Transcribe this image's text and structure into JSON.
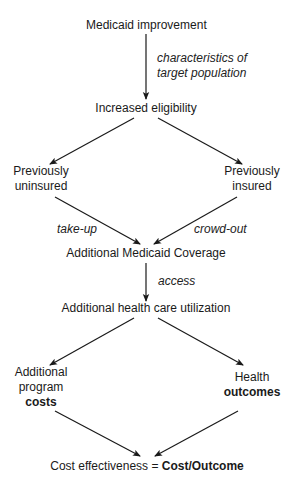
{
  "diagram": {
    "nodes": {
      "medicaid_improvement": "Medicaid improvement",
      "increased_eligibility": "Increased eligibility",
      "previously_uninsured": [
        "Previously",
        "uninsured"
      ],
      "previously_insured": [
        "Previously",
        "insured"
      ],
      "additional_coverage": "Additional Medicaid Coverage",
      "additional_utilization": "Additional health care utilization",
      "additional_costs": [
        "Additional",
        "program",
        "costs"
      ],
      "health_outcomes": [
        "Health",
        "outcomes"
      ],
      "cost_effectiveness": {
        "prefix": "Cost effectiveness = ",
        "formula": "Cost/Outcome"
      }
    },
    "edge_labels": {
      "characteristics": [
        "characteristics of",
        "target population"
      ],
      "take_up": "take-up",
      "crowd_out": "crowd-out",
      "access": "access"
    },
    "edges": [
      {
        "from": "Medicaid improvement",
        "to": "Increased eligibility",
        "label": "characteristics of target population"
      },
      {
        "from": "Increased eligibility",
        "to": "Previously uninsured"
      },
      {
        "from": "Increased eligibility",
        "to": "Previously insured"
      },
      {
        "from": "Previously uninsured",
        "to": "Additional Medicaid Coverage",
        "label": "take-up"
      },
      {
        "from": "Previously insured",
        "to": "Additional Medicaid Coverage",
        "label": "crowd-out"
      },
      {
        "from": "Additional Medicaid Coverage",
        "to": "Additional health care utilization",
        "label": "access"
      },
      {
        "from": "Additional health care utilization",
        "to": "Additional program costs"
      },
      {
        "from": "Additional health care utilization",
        "to": "Health outcomes"
      },
      {
        "from": "Additional program costs",
        "to": "Cost effectiveness"
      },
      {
        "from": "Health outcomes",
        "to": "Cost effectiveness"
      }
    ],
    "colors": {
      "text": "#1a1a1a",
      "arrow": "#1a1a1a",
      "background": "#ffffff"
    }
  }
}
